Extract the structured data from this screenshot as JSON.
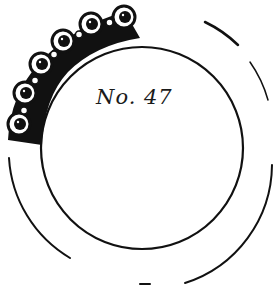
{
  "figure": {
    "label": "No. 47",
    "ink_color": "#111111",
    "paper_color": "#ffffff",
    "bead_count": 6
  }
}
